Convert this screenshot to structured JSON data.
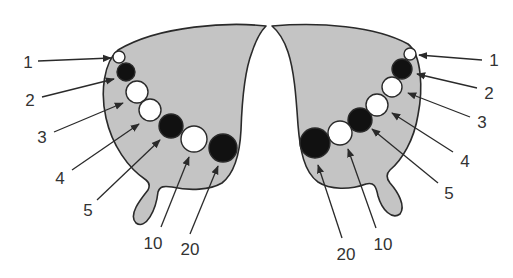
{
  "diagram": {
    "colors": {
      "wing_fill": "#c4c4c4",
      "outline": "#2a2a2a",
      "spot_black": "#111111",
      "spot_white": "#ffffff",
      "label": "#333333"
    },
    "left_wing": {
      "spots": [
        {
          "label": "1",
          "color": "white",
          "cx": 119,
          "cy": 57,
          "r": 6
        },
        {
          "label": "2",
          "color": "black",
          "cx": 126,
          "cy": 72,
          "r": 9
        },
        {
          "label": "3",
          "color": "white",
          "cx": 137,
          "cy": 92,
          "r": 11
        },
        {
          "label": "4",
          "color": "white",
          "cx": 150,
          "cy": 110,
          "r": 11
        },
        {
          "label": "5",
          "color": "black",
          "cx": 171,
          "cy": 126,
          "r": 12
        },
        {
          "label": "10",
          "color": "white",
          "cx": 194,
          "cy": 139,
          "r": 13
        },
        {
          "label": "20",
          "color": "black",
          "cx": 223,
          "cy": 148,
          "r": 14
        }
      ],
      "labels": [
        {
          "text": "1",
          "x": 28,
          "y": 62
        },
        {
          "text": "2",
          "x": 30,
          "y": 100
        },
        {
          "text": "3",
          "x": 42,
          "y": 137
        },
        {
          "text": "4",
          "x": 60,
          "y": 178
        },
        {
          "text": "5",
          "x": 88,
          "y": 210
        },
        {
          "text": "10",
          "x": 153,
          "y": 243
        },
        {
          "text": "20",
          "x": 190,
          "y": 249
        }
      ]
    },
    "right_wing": {
      "spots": [
        {
          "label": "1",
          "color": "white",
          "cx": 410,
          "cy": 54,
          "r": 6
        },
        {
          "label": "2",
          "color": "black",
          "cx": 402,
          "cy": 69,
          "r": 10
        },
        {
          "label": "3",
          "color": "white",
          "cx": 392,
          "cy": 87,
          "r": 10
        },
        {
          "label": "4",
          "color": "white",
          "cx": 377,
          "cy": 105,
          "r": 11
        },
        {
          "label": "5",
          "color": "black",
          "cx": 360,
          "cy": 120,
          "r": 12
        },
        {
          "label": "10",
          "color": "white",
          "cx": 340,
          "cy": 133,
          "r": 12
        },
        {
          "label": "20",
          "color": "black",
          "cx": 315,
          "cy": 143,
          "r": 15
        }
      ],
      "labels": [
        {
          "text": "1",
          "x": 494,
          "y": 60
        },
        {
          "text": "2",
          "x": 489,
          "y": 93
        },
        {
          "text": "3",
          "x": 482,
          "y": 122
        },
        {
          "text": "4",
          "x": 465,
          "y": 161
        },
        {
          "text": "5",
          "x": 449,
          "y": 193
        },
        {
          "text": "10",
          "x": 383,
          "y": 244
        },
        {
          "text": "20",
          "x": 346,
          "y": 254
        }
      ]
    }
  }
}
